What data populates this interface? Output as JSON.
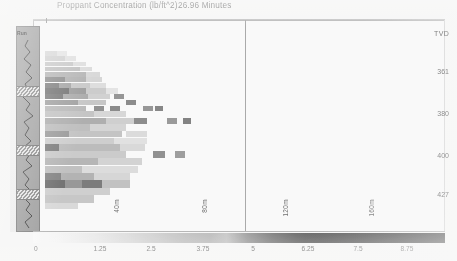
{
  "chart_data": {
    "type": "heatmap",
    "title": "Proppant Concentration (lb/ft^2)",
    "subtitle": "26.96 Minutes",
    "xlabel": "",
    "ylabel": "TVD",
    "colorbar": {
      "label": "Proppant Concentration (lb/ft^2)",
      "ticks": [
        "0",
        "1.25",
        "2.5",
        "3.75",
        "5",
        "6.25",
        "7.5",
        "8.75"
      ],
      "tick_values": [
        0,
        1.25,
        2.5,
        3.75,
        5,
        6.25,
        7.5,
        8.75
      ],
      "range": [
        0,
        10
      ],
      "orientation": "horizontal",
      "position": "bottom",
      "low_color": "#ffffff",
      "high_color": "#484848"
    },
    "yaxis": {
      "header": "TVD",
      "ticks": [
        "361",
        "380",
        "400",
        "427"
      ],
      "tick_values": [
        361,
        380,
        400,
        427
      ],
      "position": "right"
    },
    "xaxis": {
      "stage_labels": [
        "40m",
        "80m",
        "120m",
        "160m"
      ],
      "divider_at": "5"
    },
    "grid": false,
    "legend_position": "bottom",
    "series": [
      {
        "name": "proppant-concentration-field",
        "note": "faded scanned fracture-diagnostic heatmap, dense near wellbore at left, tapering to the right",
        "cells": [
          {
            "x": 0.02,
            "y": 0.14,
            "w": 0.06,
            "h": 0.022,
            "v": 1.9
          },
          {
            "x": 0.08,
            "y": 0.14,
            "w": 0.05,
            "h": 0.022,
            "v": 1.2
          },
          {
            "x": 0.02,
            "y": 0.165,
            "w": 0.1,
            "h": 0.022,
            "v": 2.4
          },
          {
            "x": 0.12,
            "y": 0.165,
            "w": 0.05,
            "h": 0.022,
            "v": 1.4
          },
          {
            "x": 0.02,
            "y": 0.19,
            "w": 0.14,
            "h": 0.022,
            "v": 2.9
          },
          {
            "x": 0.16,
            "y": 0.19,
            "w": 0.06,
            "h": 0.022,
            "v": 1.6
          },
          {
            "x": 0.02,
            "y": 0.215,
            "w": 0.17,
            "h": 0.022,
            "v": 3.4
          },
          {
            "x": 0.19,
            "y": 0.215,
            "w": 0.06,
            "h": 0.022,
            "v": 1.8
          },
          {
            "x": 0.02,
            "y": 0.24,
            "w": 0.2,
            "h": 0.024,
            "v": 4.1
          },
          {
            "x": 0.22,
            "y": 0.24,
            "w": 0.07,
            "h": 0.024,
            "v": 2.0
          },
          {
            "x": 0.02,
            "y": 0.266,
            "w": 0.1,
            "h": 0.024,
            "v": 6.6
          },
          {
            "x": 0.12,
            "y": 0.266,
            "w": 0.1,
            "h": 0.024,
            "v": 4.3
          },
          {
            "x": 0.22,
            "y": 0.266,
            "w": 0.08,
            "h": 0.024,
            "v": 2.2
          },
          {
            "x": 0.02,
            "y": 0.292,
            "w": 0.07,
            "h": 0.024,
            "v": 7.4
          },
          {
            "x": 0.09,
            "y": 0.292,
            "w": 0.06,
            "h": 0.024,
            "v": 5.1
          },
          {
            "x": 0.15,
            "y": 0.292,
            "w": 0.09,
            "h": 0.024,
            "v": 3.0
          },
          {
            "x": 0.24,
            "y": 0.292,
            "w": 0.08,
            "h": 0.024,
            "v": 1.7
          },
          {
            "x": 0.02,
            "y": 0.318,
            "w": 0.12,
            "h": 0.026,
            "v": 8.2
          },
          {
            "x": 0.14,
            "y": 0.318,
            "w": 0.08,
            "h": 0.026,
            "v": 5.6
          },
          {
            "x": 0.22,
            "y": 0.318,
            "w": 0.1,
            "h": 0.026,
            "v": 2.8
          },
          {
            "x": 0.32,
            "y": 0.318,
            "w": 0.06,
            "h": 0.026,
            "v": 1.3
          },
          {
            "x": 0.02,
            "y": 0.346,
            "w": 0.09,
            "h": 0.026,
            "v": 7.8
          },
          {
            "x": 0.11,
            "y": 0.346,
            "w": 0.12,
            "h": 0.026,
            "v": 4.8
          },
          {
            "x": 0.23,
            "y": 0.346,
            "w": 0.11,
            "h": 0.026,
            "v": 2.5
          },
          {
            "x": 0.36,
            "y": 0.346,
            "w": 0.05,
            "h": 0.026,
            "v": 6.2
          },
          {
            "x": 0.02,
            "y": 0.374,
            "w": 0.16,
            "h": 0.026,
            "v": 5.4
          },
          {
            "x": 0.18,
            "y": 0.374,
            "w": 0.14,
            "h": 0.026,
            "v": 3.1
          },
          {
            "x": 0.42,
            "y": 0.374,
            "w": 0.05,
            "h": 0.026,
            "v": 6.8
          },
          {
            "x": 0.02,
            "y": 0.402,
            "w": 0.2,
            "h": 0.026,
            "v": 3.9
          },
          {
            "x": 0.26,
            "y": 0.402,
            "w": 0.05,
            "h": 0.026,
            "v": 6.4
          },
          {
            "x": 0.34,
            "y": 0.402,
            "w": 0.05,
            "h": 0.026,
            "v": 6.9
          },
          {
            "x": 0.5,
            "y": 0.402,
            "w": 0.05,
            "h": 0.026,
            "v": 6.1
          },
          {
            "x": 0.56,
            "y": 0.402,
            "w": 0.04,
            "h": 0.026,
            "v": 7.1
          },
          {
            "x": 0.02,
            "y": 0.43,
            "w": 0.24,
            "h": 0.028,
            "v": 3.2
          },
          {
            "x": 0.26,
            "y": 0.43,
            "w": 0.16,
            "h": 0.028,
            "v": 2.1
          },
          {
            "x": 0.02,
            "y": 0.46,
            "w": 0.3,
            "h": 0.03,
            "v": 4.6
          },
          {
            "x": 0.32,
            "y": 0.46,
            "w": 0.14,
            "h": 0.03,
            "v": 2.6
          },
          {
            "x": 0.46,
            "y": 0.46,
            "w": 0.06,
            "h": 0.03,
            "v": 6.7
          },
          {
            "x": 0.62,
            "y": 0.46,
            "w": 0.05,
            "h": 0.03,
            "v": 5.9
          },
          {
            "x": 0.7,
            "y": 0.46,
            "w": 0.04,
            "h": 0.03,
            "v": 7.3
          },
          {
            "x": 0.02,
            "y": 0.492,
            "w": 0.22,
            "h": 0.03,
            "v": 3.6
          },
          {
            "x": 0.24,
            "y": 0.492,
            "w": 0.18,
            "h": 0.03,
            "v": 2.3
          },
          {
            "x": 0.02,
            "y": 0.524,
            "w": 0.12,
            "h": 0.03,
            "v": 5.8
          },
          {
            "x": 0.14,
            "y": 0.524,
            "w": 0.26,
            "h": 0.03,
            "v": 3.3
          },
          {
            "x": 0.42,
            "y": 0.524,
            "w": 0.1,
            "h": 0.03,
            "v": 1.9
          },
          {
            "x": 0.02,
            "y": 0.556,
            "w": 0.34,
            "h": 0.03,
            "v": 2.7
          },
          {
            "x": 0.36,
            "y": 0.556,
            "w": 0.16,
            "h": 0.03,
            "v": 1.5
          },
          {
            "x": 0.02,
            "y": 0.588,
            "w": 0.07,
            "h": 0.032,
            "v": 7.6
          },
          {
            "x": 0.09,
            "y": 0.588,
            "w": 0.3,
            "h": 0.032,
            "v": 3.8
          },
          {
            "x": 0.39,
            "y": 0.588,
            "w": 0.12,
            "h": 0.032,
            "v": 2.0
          },
          {
            "x": 0.02,
            "y": 0.622,
            "w": 0.4,
            "h": 0.032,
            "v": 2.9
          },
          {
            "x": 0.55,
            "y": 0.622,
            "w": 0.06,
            "h": 0.032,
            "v": 6.5
          },
          {
            "x": 0.66,
            "y": 0.622,
            "w": 0.05,
            "h": 0.032,
            "v": 5.7
          },
          {
            "x": 0.02,
            "y": 0.656,
            "w": 0.26,
            "h": 0.032,
            "v": 4.2
          },
          {
            "x": 0.28,
            "y": 0.656,
            "w": 0.22,
            "h": 0.032,
            "v": 2.4
          },
          {
            "x": 0.02,
            "y": 0.69,
            "w": 0.18,
            "h": 0.034,
            "v": 3.5
          },
          {
            "x": 0.2,
            "y": 0.69,
            "w": 0.28,
            "h": 0.034,
            "v": 1.8
          },
          {
            "x": 0.02,
            "y": 0.726,
            "w": 0.08,
            "h": 0.034,
            "v": 7.2
          },
          {
            "x": 0.1,
            "y": 0.726,
            "w": 0.16,
            "h": 0.034,
            "v": 4.4
          },
          {
            "x": 0.26,
            "y": 0.726,
            "w": 0.18,
            "h": 0.034,
            "v": 2.2
          },
          {
            "x": 0.02,
            "y": 0.762,
            "w": 0.1,
            "h": 0.034,
            "v": 8.4
          },
          {
            "x": 0.12,
            "y": 0.762,
            "w": 0.08,
            "h": 0.034,
            "v": 6.0
          },
          {
            "x": 0.2,
            "y": 0.762,
            "w": 0.1,
            "h": 0.034,
            "v": 7.8
          },
          {
            "x": 0.3,
            "y": 0.762,
            "w": 0.14,
            "h": 0.034,
            "v": 3.4
          },
          {
            "x": 0.02,
            "y": 0.798,
            "w": 0.32,
            "h": 0.034,
            "v": 2.6
          },
          {
            "x": 0.02,
            "y": 0.834,
            "w": 0.24,
            "h": 0.034,
            "v": 3.1
          },
          {
            "x": 0.02,
            "y": 0.87,
            "w": 0.16,
            "h": 0.03,
            "v": 2.0
          }
        ]
      }
    ]
  },
  "header": {
    "title": "Proppant Concentration (lb/ft^2)",
    "elapsed": "26.96 Minutes"
  },
  "log_track": {
    "label": "Run"
  },
  "depth_axis": {
    "header": "TVD",
    "ticks": [
      {
        "label": "361",
        "top": 68
      },
      {
        "label": "380",
        "top": 110
      },
      {
        "label": "400",
        "top": 152
      },
      {
        "label": "427",
        "top": 191
      }
    ]
  },
  "stage_labels": [
    {
      "label": "40m",
      "left": 113,
      "top": 199
    },
    {
      "label": "80m",
      "left": 201,
      "top": 199
    },
    {
      "label": "120m",
      "left": 282,
      "top": 199
    },
    {
      "label": "160m",
      "left": 368,
      "top": 199
    }
  ],
  "colorbar_ticks": [
    {
      "label": "0",
      "left": 34
    },
    {
      "label": "1.25",
      "left": 100
    },
    {
      "label": "2.5",
      "left": 151
    },
    {
      "label": "3.75",
      "left": 203
    },
    {
      "label": "5",
      "left": 253
    },
    {
      "label": "6.25",
      "left": 308
    },
    {
      "label": "7.5",
      "left": 358
    },
    {
      "label": "8.75",
      "left": 407
    }
  ]
}
